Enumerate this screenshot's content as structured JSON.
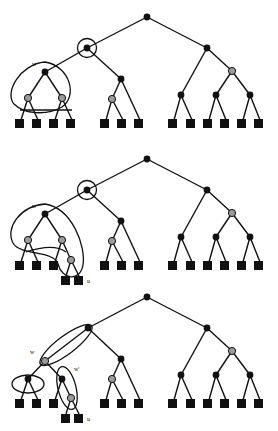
{
  "figure": {
    "title": "",
    "width": 278,
    "height": 431,
    "background": "#ffffff",
    "panel_count": 3
  },
  "colors": {
    "edge": "#111111",
    "internal_node": "#111111",
    "gray_node": "#9a9a9a",
    "gray_node_stroke": "#111111",
    "leaf": "#111111",
    "blob_stroke": "#111111",
    "label_text": "#111111",
    "background": "#ffffff"
  },
  "labels": {
    "w": "w",
    "w_prime": "w'",
    "u": "u"
  },
  "panels": [
    {
      "id": "panel-top",
      "name": "panel-top",
      "annotations": [
        {
          "name": "label-w",
          "text": "w",
          "x": 32,
          "y": 66
        }
      ],
      "highlight_shapes": [
        {
          "name": "circle-around-node",
          "type": "circle",
          "cx": 87,
          "cy": 48,
          "r": 9
        },
        {
          "name": "blob-around-subtree-w",
          "type": "blob"
        }
      ],
      "nodes": [
        {
          "name": "root",
          "kind": "black",
          "x": 147,
          "y": 17
        },
        {
          "name": "left-child",
          "kind": "black",
          "x": 87,
          "y": 48
        },
        {
          "name": "right-child",
          "kind": "black",
          "x": 207,
          "y": 48
        },
        {
          "name": "w-node",
          "kind": "black",
          "x": 45,
          "y": 72
        },
        {
          "name": "mid-node",
          "kind": "black",
          "x": 121,
          "y": 79
        },
        {
          "name": "right-gray",
          "kind": "gray",
          "x": 232,
          "y": 71
        },
        {
          "name": "w-left-gray",
          "kind": "gray",
          "x": 28,
          "y": 98
        },
        {
          "name": "w-right-gray",
          "kind": "gray",
          "x": 62,
          "y": 98
        },
        {
          "name": "mid-gray",
          "kind": "gray",
          "x": 112,
          "y": 99
        },
        {
          "name": "r1",
          "kind": "black",
          "x": 181,
          "y": 95
        },
        {
          "name": "r2",
          "kind": "black",
          "x": 216,
          "y": 95
        },
        {
          "name": "r3",
          "kind": "black",
          "x": 250,
          "y": 95
        }
      ],
      "leaves": [
        {
          "name": "leaf",
          "x": 19,
          "y": 122
        },
        {
          "name": "leaf",
          "x": 36,
          "y": 122
        },
        {
          "name": "leaf",
          "x": 53,
          "y": 122
        },
        {
          "name": "leaf",
          "x": 70,
          "y": 122
        },
        {
          "name": "leaf",
          "x": 104,
          "y": 122
        },
        {
          "name": "leaf",
          "x": 121,
          "y": 122
        },
        {
          "name": "leaf",
          "x": 138,
          "y": 122
        },
        {
          "name": "leaf",
          "x": 172,
          "y": 122
        },
        {
          "name": "leaf",
          "x": 190,
          "y": 122
        },
        {
          "name": "leaf",
          "x": 207,
          "y": 122
        },
        {
          "name": "leaf",
          "x": 224,
          "y": 122
        },
        {
          "name": "leaf",
          "x": 241,
          "y": 122
        },
        {
          "name": "leaf",
          "x": 258,
          "y": 122
        }
      ]
    },
    {
      "id": "panel-middle",
      "name": "panel-middle",
      "annotations": [
        {
          "name": "label-w",
          "text": "w",
          "x": 32,
          "y": 208
        },
        {
          "name": "label-u",
          "text": "u",
          "x": 82,
          "y": 272
        }
      ],
      "highlight_shapes": [
        {
          "name": "circle-around-node",
          "type": "circle",
          "cx": 87,
          "cy": 190,
          "r": 9
        },
        {
          "name": "blob-around-subtree-w-and-u",
          "type": "blob"
        }
      ],
      "nodes": [
        {
          "name": "root",
          "kind": "black",
          "x": 147,
          "y": 159
        },
        {
          "name": "left-child",
          "kind": "black",
          "x": 87,
          "y": 190
        },
        {
          "name": "right-child",
          "kind": "black",
          "x": 207,
          "y": 190
        },
        {
          "name": "w-node",
          "kind": "black",
          "x": 45,
          "y": 214
        },
        {
          "name": "mid-node",
          "kind": "black",
          "x": 121,
          "y": 221
        },
        {
          "name": "right-gray",
          "kind": "gray",
          "x": 232,
          "y": 213
        },
        {
          "name": "w-left-gray",
          "kind": "gray",
          "x": 28,
          "y": 240
        },
        {
          "name": "w-right-gray",
          "kind": "gray",
          "x": 62,
          "y": 240
        },
        {
          "name": "u-node",
          "kind": "gray",
          "x": 71,
          "y": 260
        },
        {
          "name": "mid-gray",
          "kind": "gray",
          "x": 112,
          "y": 241
        },
        {
          "name": "r1",
          "kind": "black",
          "x": 181,
          "y": 237
        },
        {
          "name": "r2",
          "kind": "black",
          "x": 216,
          "y": 237
        },
        {
          "name": "r3",
          "kind": "black",
          "x": 250,
          "y": 237
        }
      ],
      "leaves": [
        {
          "name": "leaf",
          "x": 19,
          "y": 264
        },
        {
          "name": "leaf",
          "x": 36,
          "y": 264
        },
        {
          "name": "leaf",
          "x": 53,
          "y": 264
        },
        {
          "name": "leaf",
          "x": 65,
          "y": 279
        },
        {
          "name": "leaf",
          "x": 78,
          "y": 279
        },
        {
          "name": "leaf",
          "x": 104,
          "y": 264
        },
        {
          "name": "leaf",
          "x": 121,
          "y": 264
        },
        {
          "name": "leaf",
          "x": 138,
          "y": 264
        },
        {
          "name": "leaf",
          "x": 172,
          "y": 264
        },
        {
          "name": "leaf",
          "x": 190,
          "y": 264
        },
        {
          "name": "leaf",
          "x": 207,
          "y": 264
        },
        {
          "name": "leaf",
          "x": 224,
          "y": 264
        },
        {
          "name": "leaf",
          "x": 241,
          "y": 264
        },
        {
          "name": "leaf",
          "x": 258,
          "y": 264
        }
      ]
    },
    {
      "id": "panel-bottom",
      "name": "panel-bottom",
      "annotations": [
        {
          "name": "label-w",
          "text": "w",
          "x": 33,
          "y": 351
        },
        {
          "name": "label-w-prime",
          "text": "w'",
          "x": 76,
          "y": 369
        },
        {
          "name": "label-u",
          "text": "u",
          "x": 81,
          "y": 413
        }
      ],
      "highlight_shapes": [
        {
          "name": "ellipse-w-path",
          "type": "ellipse-slanted"
        },
        {
          "name": "ellipse-left-cluster",
          "type": "ellipse"
        },
        {
          "name": "ellipse-w-prime-cluster",
          "type": "ellipse-slanted"
        }
      ],
      "nodes": [
        {
          "name": "root",
          "kind": "black",
          "x": 147,
          "y": 297
        },
        {
          "name": "left-child",
          "kind": "black",
          "x": 88,
          "y": 328
        },
        {
          "name": "right-child",
          "kind": "black",
          "x": 207,
          "y": 328
        },
        {
          "name": "w-node",
          "kind": "gray",
          "x": 45,
          "y": 361
        },
        {
          "name": "mid-node",
          "kind": "black",
          "x": 121,
          "y": 359
        },
        {
          "name": "right-gray",
          "kind": "gray",
          "x": 232,
          "y": 351
        },
        {
          "name": "left-cluster-node",
          "kind": "black",
          "x": 28,
          "y": 379
        },
        {
          "name": "w-prime-node",
          "kind": "black",
          "x": 62,
          "y": 379
        },
        {
          "name": "u-node",
          "kind": "gray",
          "x": 71,
          "y": 398
        },
        {
          "name": "mid-gray",
          "kind": "gray",
          "x": 112,
          "y": 379
        },
        {
          "name": "r1",
          "kind": "black",
          "x": 181,
          "y": 375
        },
        {
          "name": "r2",
          "kind": "black",
          "x": 216,
          "y": 375
        },
        {
          "name": "r3",
          "kind": "black",
          "x": 250,
          "y": 375
        }
      ],
      "leaves": [
        {
          "name": "leaf",
          "x": 19,
          "y": 402
        },
        {
          "name": "leaf",
          "x": 36,
          "y": 402
        },
        {
          "name": "leaf",
          "x": 53,
          "y": 402
        },
        {
          "name": "leaf",
          "x": 65,
          "y": 417
        },
        {
          "name": "leaf",
          "x": 78,
          "y": 417
        },
        {
          "name": "leaf",
          "x": 104,
          "y": 402
        },
        {
          "name": "leaf",
          "x": 121,
          "y": 402
        },
        {
          "name": "leaf",
          "x": 138,
          "y": 402
        },
        {
          "name": "leaf",
          "x": 172,
          "y": 402
        },
        {
          "name": "leaf",
          "x": 190,
          "y": 402
        },
        {
          "name": "leaf",
          "x": 207,
          "y": 402
        },
        {
          "name": "leaf",
          "x": 224,
          "y": 402
        },
        {
          "name": "leaf",
          "x": 241,
          "y": 402
        },
        {
          "name": "leaf",
          "x": 258,
          "y": 402
        }
      ]
    }
  ]
}
